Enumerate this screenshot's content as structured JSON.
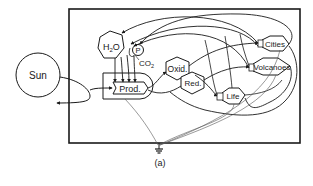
{
  "diagram": {
    "caption": "(a)",
    "nodes": {
      "sun": "Sun",
      "h2o": "H",
      "h2o_sub": "2",
      "h2o_tail": "O",
      "p": "P",
      "co2": "CO",
      "co2_sub": "2",
      "prod": "Prod.",
      "oxid": "Oxid.",
      "red": "Red.",
      "cities": "Cities",
      "volcanoes": "Volcanoes",
      "life": "Life"
    },
    "colors": {
      "line": "#1a1a1a",
      "background": "#ffffff"
    }
  }
}
